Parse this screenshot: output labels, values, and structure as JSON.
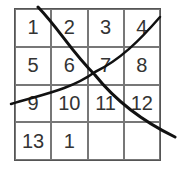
{
  "grid": {
    "rows": 4,
    "cols": 4,
    "cells": [
      "1",
      "2",
      "3",
      "4",
      "5",
      "6",
      "7",
      "8",
      "9",
      "10",
      "11",
      "12",
      "13",
      "1",
      "",
      ""
    ]
  },
  "strokes": [
    {
      "name": "diagonal-stroke",
      "color": "#111111"
    },
    {
      "name": "curved-stroke",
      "color": "#111111"
    }
  ]
}
